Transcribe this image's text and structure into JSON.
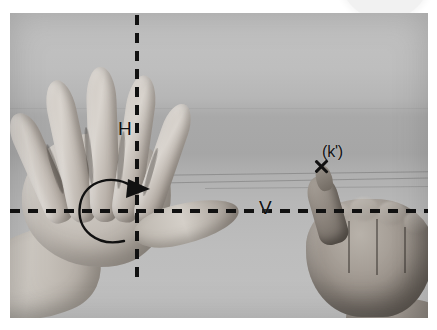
{
  "figure": {
    "type": "photograph-with-annotations",
    "media": "grayscale scanned photograph",
    "background_color": "#ffffff",
    "photo_tone": "#b4b4b4",
    "annotation_color": "#111111"
  },
  "annotations": {
    "axis_vertical_label": "H",
    "axis_horizontal_label": "V",
    "point_label": "(k')",
    "point_marker": "x-mark",
    "rotation_indicator": "circular-arrow"
  },
  "scene": {
    "left_hand": "open left hand, fingers spread, palm down",
    "right_hand": "closed right fist with thumb raised",
    "artifact": "faint rounded scan artifact at top right"
  }
}
